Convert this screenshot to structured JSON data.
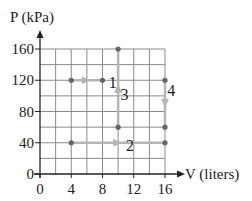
{
  "chart_data": {
    "type": "line",
    "title": "",
    "xlabel": "V (liters)",
    "ylabel": "P (kPa)",
    "xlim": [
      0,
      16
    ],
    "ylim": [
      0,
      160
    ],
    "x_ticks": [
      0,
      4,
      8,
      12,
      16
    ],
    "y_ticks": [
      0,
      40,
      80,
      120,
      160
    ],
    "x_tick_labels": [
      "0",
      "4",
      "8",
      "12",
      "16"
    ],
    "y_tick_labels": [
      "0",
      "40",
      "80",
      "120",
      "160"
    ],
    "grid": {
      "on": true,
      "x_step": 2,
      "y_step": 20
    },
    "legend": null,
    "series": [
      {
        "name": "1",
        "points": [
          [
            4,
            120
          ],
          [
            8,
            120
          ]
        ],
        "direction": "right"
      },
      {
        "name": "2",
        "points": [
          [
            4,
            40
          ],
          [
            16,
            40
          ]
        ],
        "direction": "right"
      },
      {
        "name": "3",
        "points": [
          [
            10,
            60
          ],
          [
            10,
            160
          ]
        ],
        "direction": "up"
      },
      {
        "name": "4",
        "points": [
          [
            16,
            120
          ],
          [
            16,
            60
          ]
        ],
        "direction": "down"
      }
    ],
    "annotations": [
      {
        "text": "1",
        "x": 8.8,
        "y": 110
      },
      {
        "text": "2",
        "x": 11,
        "y": 30
      },
      {
        "text": "3",
        "x": 10.3,
        "y": 95
      },
      {
        "text": "4",
        "x": 16.3,
        "y": 100
      }
    ]
  },
  "colors": {
    "axis": "#222222",
    "grid": "#8a8a8a",
    "path": "#b5b5b5",
    "point": "#666666",
    "text": "#222222"
  }
}
